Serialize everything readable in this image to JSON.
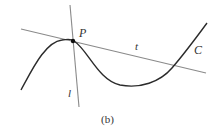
{
  "figure": {
    "caption": "(b)",
    "labels": {
      "point": "P",
      "tangent": "t",
      "normal": "l",
      "curve": "C"
    },
    "colors": {
      "curve": "#2b2b2b",
      "lines": "#8a8a8a",
      "point": "#111111",
      "text": "#333333"
    },
    "elements": {
      "curve_C": "smooth cubic-like curve with local maximum at P and local minimum to the right",
      "tangent_line_t": "line tangent to C at P, crossing C again on the right",
      "normal_line_l": "line through P perpendicular-ish to t",
      "point_P": "filled dot at local maximum of C"
    }
  }
}
